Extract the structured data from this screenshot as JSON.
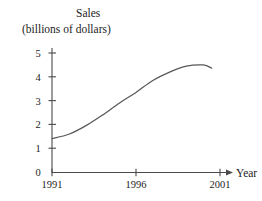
{
  "figure": {
    "title": "Sales",
    "subtitle": "(billions of dollars)",
    "x_axis_name": "Year",
    "line_color": "#585858",
    "axis_color": "#4a4a4a",
    "background_color": "#ffffff"
  },
  "chart_data": {
    "type": "line",
    "title": "Sales",
    "subtitle": "(billions of dollars)",
    "xlabel": "Year",
    "ylabel": "Sales (billions of dollars)",
    "xlim": [
      1991,
      2001
    ],
    "ylim": [
      0,
      5
    ],
    "grid": false,
    "legend": null,
    "x_tick_labels": [
      "1991",
      "1996",
      "2001"
    ],
    "x_tick_values": [
      1991,
      1996,
      2001
    ],
    "y_tick_labels": [
      "0",
      "1",
      "2",
      "3",
      "4",
      "5"
    ],
    "y_tick_values": [
      0,
      1,
      2,
      3,
      4,
      5
    ],
    "x_axis_arrow": true,
    "series": [
      {
        "name": "Sales",
        "x": [
          1991,
          1992,
          1993,
          1994,
          1995,
          1996,
          1997,
          1998,
          1999,
          2000,
          2000.5
        ],
        "values": [
          1.42,
          1.6,
          1.95,
          2.4,
          2.9,
          3.35,
          3.85,
          4.2,
          4.45,
          4.5,
          4.37
        ]
      }
    ],
    "annotations": []
  },
  "labels": {
    "y_0": "0",
    "y_1": "1",
    "y_2": "2",
    "y_3": "3",
    "y_4": "4",
    "y_5": "5",
    "x_1991": "1991",
    "x_1996": "1996",
    "x_2001": "2001"
  }
}
